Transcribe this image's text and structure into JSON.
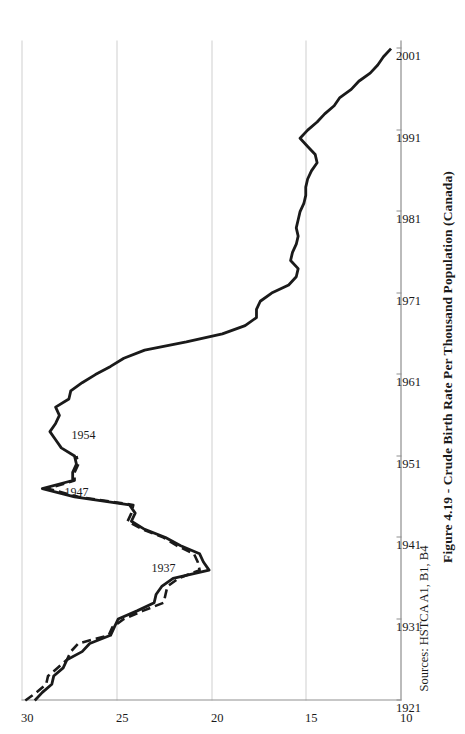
{
  "figure": {
    "title": "Figure 4.19 - Crude Birth Rate Per Thousand Population (Canada)",
    "source": "Sources: HSTCA A1, B1, B4",
    "orientation": "rotated-90-ccw",
    "line_color": "#1a1a1a",
    "grid_color": "#d0d0d0",
    "axis_color": "#8f8f8f"
  },
  "annotations": [
    {
      "label": "1947",
      "year": 1947,
      "value": 28.9
    },
    {
      "label": "1954",
      "year": 1954,
      "value": 28.5
    },
    {
      "label": "1937",
      "year": 1937,
      "value": 20.1
    }
  ],
  "chart_data": {
    "type": "line",
    "title": "Figure 4.19 - Crude Birth Rate Per Thousand Population (Canada)",
    "xlabel": "",
    "ylabel": "",
    "xlim": [
      1921,
      2002
    ],
    "ylim": [
      10,
      30
    ],
    "grid": true,
    "legend": "none",
    "xticks": [
      1921,
      1931,
      1941,
      1951,
      1961,
      1971,
      1981,
      1991,
      2001
    ],
    "yticks": [
      10,
      15,
      20,
      25,
      30
    ],
    "series": [
      {
        "name": "Crude birth rate (solid)",
        "style": "solid",
        "x": [
          1921,
          1922,
          1923,
          1924,
          1925,
          1926,
          1927,
          1928,
          1929,
          1930,
          1931,
          1932,
          1933,
          1934,
          1935,
          1936,
          1937,
          1938,
          1939,
          1940,
          1941,
          1942,
          1943,
          1944,
          1945,
          1946,
          1947,
          1948,
          1949,
          1950,
          1951,
          1952,
          1953,
          1954,
          1955,
          1956,
          1957,
          1958,
          1959,
          1960,
          1961,
          1962,
          1963,
          1964,
          1965,
          1966,
          1967,
          1968,
          1969,
          1970,
          1971,
          1972,
          1973,
          1974,
          1975,
          1976,
          1977,
          1978,
          1979,
          1980,
          1981,
          1982,
          1983,
          1984,
          1985,
          1986,
          1987,
          1988,
          1989,
          1990,
          1991,
          1992,
          1993,
          1994,
          1995,
          1996,
          1997,
          1998,
          1999,
          2000,
          2001
        ],
        "y": [
          29.3,
          28.9,
          28.4,
          28.3,
          27.8,
          27.6,
          26.8,
          26.4,
          25.3,
          25.1,
          24.9,
          23.9,
          23.0,
          22.9,
          22.6,
          22.0,
          20.1,
          20.4,
          20.6,
          21.6,
          22.4,
          23.5,
          24.2,
          24.0,
          24.3,
          27.2,
          28.9,
          27.3,
          27.3,
          27.1,
          27.2,
          27.9,
          28.2,
          28.5,
          28.2,
          28.0,
          28.2,
          27.5,
          27.4,
          26.8,
          26.1,
          25.3,
          24.6,
          23.5,
          21.3,
          19.4,
          18.2,
          17.6,
          17.6,
          17.4,
          16.8,
          15.9,
          15.5,
          15.4,
          15.8,
          15.7,
          15.5,
          15.4,
          15.5,
          15.4,
          15.3,
          15.1,
          15.0,
          15.0,
          14.9,
          14.7,
          14.4,
          14.5,
          14.9,
          15.3,
          14.9,
          14.4,
          14.0,
          13.5,
          13.2,
          12.6,
          12.2,
          11.6,
          11.2,
          10.9,
          10.5
        ]
      },
      {
        "name": "Crude birth rate (dashed, alternate estimate)",
        "style": "dashed",
        "x": [
          1921,
          1922,
          1923,
          1924,
          1925,
          1926,
          1927,
          1928,
          1929,
          1930,
          1931,
          1932,
          1933,
          1934,
          1935,
          1936,
          1937,
          1938,
          1939,
          1940,
          1941,
          1942,
          1943,
          1944,
          1945,
          1946,
          1947,
          1948,
          1949,
          1950,
          1951
        ],
        "y": [
          29.8,
          29.2,
          28.7,
          28.6,
          28.1,
          27.6,
          27.4,
          27.0,
          25.4,
          25.2,
          24.6,
          23.6,
          22.5,
          22.4,
          22.3,
          21.7,
          20.6,
          20.7,
          20.9,
          21.8,
          22.5,
          23.6,
          24.4,
          24.2,
          24.1,
          27.0,
          28.6,
          27.2,
          27.2,
          27.0,
          27.1
        ]
      }
    ]
  }
}
